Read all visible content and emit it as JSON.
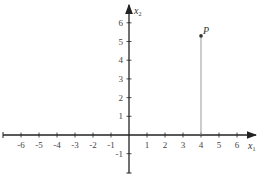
{
  "diagram": {
    "type": "cartesian-plane",
    "origin_px": [
      129,
      135
    ],
    "x_unit_px": 18,
    "y_unit_px": 18.7,
    "axes": {
      "x": {
        "label": "x",
        "subscript": "1",
        "ticks": [
          -6,
          -5,
          -4,
          -3,
          -2,
          -1,
          1,
          2,
          3,
          4,
          5,
          6
        ]
      },
      "y": {
        "label": "x",
        "subscript": "2",
        "ticks": [
          -1,
          1,
          2,
          3,
          4,
          5,
          6
        ]
      }
    },
    "point": {
      "label": "P",
      "x": 4,
      "y": 5.3
    },
    "colors": {
      "axis": "#222222",
      "drop_line": "#999999",
      "point": "#333333"
    }
  }
}
